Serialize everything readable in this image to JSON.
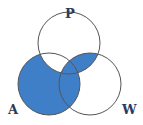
{
  "diagram": {
    "type": "venn-3",
    "labels": {
      "top": "P",
      "left": "A",
      "right": "W"
    },
    "shaded_regions": [
      "A only",
      "A and W only",
      "P and W only",
      "A and P and W"
    ],
    "unshaded_regions": [
      "P only",
      "W only",
      "A and P only"
    ],
    "colors": {
      "fill": "#3f7fc8",
      "stroke": "#555555",
      "background": "#ffffff"
    }
  }
}
